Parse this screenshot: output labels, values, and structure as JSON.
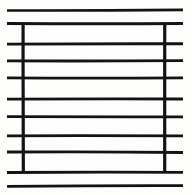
{
  "figure": {
    "title": "Ruled Box Sketch",
    "medium": "scanned line drawing",
    "ink_color": "#131313",
    "paper_color": "#fdfdfb",
    "canvas": {
      "width": 192,
      "height": 195
    }
  },
  "chart_data": {
    "type": "line",
    "title": "Ruled Box Sketch",
    "subtitle": "",
    "xlabel": "",
    "ylabel": "",
    "xlim": [
      0,
      192
    ],
    "ylim": [
      0,
      195
    ],
    "grid": false,
    "legend": "none",
    "box": {
      "name": "rectangle",
      "x_left": 23,
      "x_right": 165,
      "y_top": 24,
      "y_bottom": 172,
      "stroke_width": 3.2
    },
    "series": [
      {
        "name": "horizontal-rules",
        "stroke_width": 2.6,
        "values": [
          {
            "index": 1,
            "y": 10,
            "x_start": 7,
            "x_end": 183,
            "inside_box": false,
            "label": "rule-above-box"
          },
          {
            "index": 2,
            "y": 24,
            "x_start": 7,
            "x_end": 183,
            "inside_box": true,
            "label": "box-top-edge-rule"
          },
          {
            "index": 3,
            "y": 44,
            "x_start": 7,
            "x_end": 183,
            "inside_box": true,
            "label": "rule-1"
          },
          {
            "index": 4,
            "y": 61,
            "x_start": 7,
            "x_end": 183,
            "inside_box": true,
            "label": "rule-2"
          },
          {
            "index": 5,
            "y": 78,
            "x_start": 7,
            "x_end": 183,
            "inside_box": true,
            "label": "rule-3"
          },
          {
            "index": 6,
            "y": 99,
            "x_start": 7,
            "x_end": 183,
            "inside_box": true,
            "label": "rule-4"
          },
          {
            "index": 7,
            "y": 117,
            "x_start": 7,
            "x_end": 183,
            "inside_box": true,
            "label": "rule-5"
          },
          {
            "index": 8,
            "y": 136,
            "x_start": 7,
            "x_end": 183,
            "inside_box": true,
            "label": "rule-6"
          },
          {
            "index": 9,
            "y": 152,
            "x_start": 7,
            "x_end": 183,
            "inside_box": true,
            "label": "rule-7"
          },
          {
            "index": 10,
            "y": 172,
            "x_start": 7,
            "x_end": 183,
            "inside_box": true,
            "label": "box-bottom-edge-rule"
          },
          {
            "index": 11,
            "y": 186,
            "x_start": 7,
            "x_end": 183,
            "inside_box": false,
            "label": "rule-below-box"
          }
        ]
      },
      {
        "name": "vertical-sides",
        "stroke_width": 3.2,
        "values": [
          {
            "index": 1,
            "x": 23,
            "y_start": 24,
            "y_end": 172,
            "label": "left-side"
          },
          {
            "index": 2,
            "x": 165,
            "y_start": 24,
            "y_end": 172,
            "label": "right-side"
          }
        ]
      }
    ],
    "counts": {
      "horizontal_lines_total": 11,
      "horizontal_lines_crossing_box": 9,
      "horizontal_lines_outside_box": 2,
      "vertical_lines": 2,
      "row_bands_inside_box": 8
    }
  }
}
